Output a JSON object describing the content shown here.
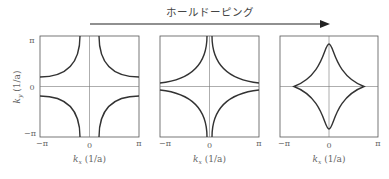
{
  "title": "ホールドーピング",
  "y_axis_label": "k_y (1/a)",
  "panels": [
    {
      "x_label": "k_x (1/a)",
      "x_ticks": [
        "−π",
        "0",
        "π"
      ],
      "shape": "hyperbolic-open"
    },
    {
      "x_label": "k_x (1/a)",
      "x_ticks": [
        "−π",
        "0",
        "π"
      ],
      "shape": "van-hove"
    },
    {
      "x_label": "k_x (1/a)",
      "x_ticks": [
        "−π",
        "0",
        "π"
      ],
      "shape": "closed-diamond"
    }
  ],
  "y_ticks": [
    "π",
    "0",
    "−π"
  ],
  "x_label_text": "k",
  "x_label_sub": "x",
  "y_label_sub": "y",
  "unit": "(1/a)"
}
